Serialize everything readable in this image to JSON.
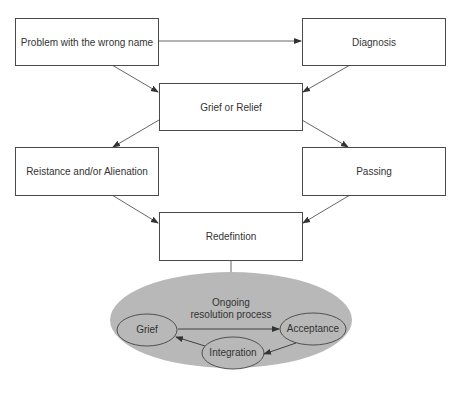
{
  "diagram": {
    "nodes": [
      {
        "id": "problem",
        "label": "Problem with the wrong name"
      },
      {
        "id": "diagnosis",
        "label": "Diagnosis"
      },
      {
        "id": "grief_relief",
        "label": "Grief or Relief"
      },
      {
        "id": "resistance",
        "label": "Reistance and/or Alienation"
      },
      {
        "id": "passing",
        "label": "Passing"
      },
      {
        "id": "redefinition",
        "label": "Redefintion"
      }
    ],
    "cycle": {
      "title_line1": "Ongoing",
      "title_line2": "resolution process",
      "nodes": [
        {
          "id": "grief",
          "label": "Grief"
        },
        {
          "id": "acceptance",
          "label": "Acceptance"
        },
        {
          "id": "integration",
          "label": "Integration"
        }
      ],
      "fill_color": "#b8b8b8"
    },
    "edges": [
      {
        "from": "problem",
        "to": "diagnosis"
      },
      {
        "from": "problem",
        "to": "grief_relief"
      },
      {
        "from": "diagnosis",
        "to": "grief_relief"
      },
      {
        "from": "grief_relief",
        "to": "resistance"
      },
      {
        "from": "grief_relief",
        "to": "passing"
      },
      {
        "from": "resistance",
        "to": "redefinition"
      },
      {
        "from": "passing",
        "to": "redefinition"
      },
      {
        "from": "redefinition",
        "to": "cycle"
      },
      {
        "from": "grief",
        "to": "acceptance"
      },
      {
        "from": "acceptance",
        "to": "integration"
      },
      {
        "from": "integration",
        "to": "grief"
      }
    ]
  }
}
